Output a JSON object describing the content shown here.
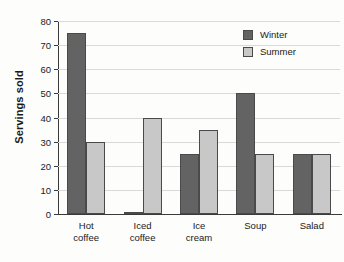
{
  "chart_data": {
    "type": "bar",
    "title": "",
    "subtitle": "",
    "xlabel": "",
    "ylabel": "Servings sold",
    "categories": [
      "Hot coffee",
      "Iced coffee",
      "Ice cream",
      "Soup",
      "Salad"
    ],
    "category_lines": [
      [
        "Hot",
        "coffee"
      ],
      [
        "Iced",
        "coffee"
      ],
      [
        "Ice",
        "cream"
      ],
      [
        "Soup"
      ],
      [
        "Salad"
      ]
    ],
    "series": [
      {
        "name": "Winter",
        "color": "#636363",
        "values": [
          75,
          1,
          25,
          50,
          25
        ]
      },
      {
        "name": "Summer",
        "color": "#c8c8c8",
        "values": [
          30,
          40,
          35,
          25,
          25
        ]
      }
    ],
    "ylim": [
      0,
      80
    ],
    "yticks": [
      0,
      10,
      20,
      30,
      40,
      50,
      60,
      70,
      80
    ],
    "ytick_labels": [
      "0",
      "10",
      "20",
      "30",
      "40",
      "50",
      "60",
      "70",
      "80"
    ],
    "grid": true,
    "grid_axis": "y",
    "legend_position": "top-right",
    "legend": [
      "Winter",
      "Summer"
    ]
  },
  "colors": {
    "winter": "#636363",
    "summer": "#c8c8c8",
    "grid": "#d9d9d9",
    "axis": "#3a3a3a",
    "background": "#fdfdfb",
    "text": "#1a1a1a"
  }
}
